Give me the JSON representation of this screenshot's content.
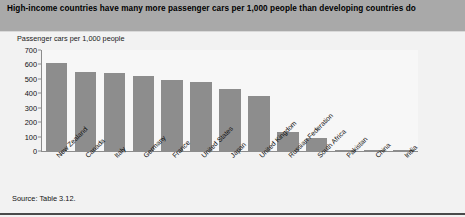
{
  "title": "High-income countries have many more passenger cars per 1,000 people than developing countries do",
  "subtitle": "Passenger cars per 1,000 people",
  "source": "Source: Table 3.12.",
  "colors": {
    "title_band": "#a9a9a9",
    "bar_fill": "#8d8d8d",
    "panel_background": "#f2f2f2",
    "plot_background": "#f7f7f7",
    "axis_line": "#8c8c8c",
    "rule": "#4a4a4a"
  },
  "chart_data": {
    "type": "bar",
    "title": "High-income countries have many more passenger cars per 1,000 people than developing countries do",
    "subtitle": "Passenger cars per 1,000 people",
    "xlabel": "",
    "ylabel": "Passenger cars per 1,000 people",
    "ylim": [
      0,
      700
    ],
    "yticks": [
      0,
      100,
      200,
      300,
      400,
      500,
      600,
      700
    ],
    "ytick_labels": [
      "0",
      "100",
      "200",
      "300",
      "400",
      "500",
      "600",
      "700"
    ],
    "grid": false,
    "legend": "none",
    "categories": [
      "New Zealand",
      "Canada",
      "Italy",
      "Germany",
      "France",
      "United States",
      "Japan",
      "United Kingdom",
      "Russian Federation",
      "South Africa",
      "Pakistan",
      "China",
      "India"
    ],
    "values": [
      610,
      550,
      540,
      520,
      490,
      480,
      430,
      380,
      130,
      90,
      8,
      6,
      5
    ],
    "series": [
      {
        "name": "Passenger cars per 1,000 people",
        "values": [
          610,
          550,
          540,
          520,
          490,
          480,
          430,
          380,
          130,
          90,
          8,
          6,
          5
        ]
      }
    ]
  }
}
